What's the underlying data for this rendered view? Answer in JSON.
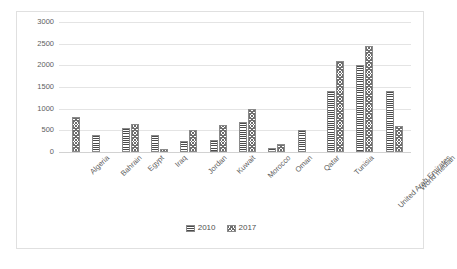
{
  "chart_data": {
    "type": "bar",
    "title": "",
    "subtitle": "",
    "xlabel": "",
    "ylabel": "",
    "ylim": [
      0,
      3000
    ],
    "yticks": [
      0,
      500,
      1000,
      1500,
      2000,
      2500,
      3000
    ],
    "ytick_labels": [
      "0",
      "500",
      "1000",
      "1500",
      "2000",
      "2500",
      "3000"
    ],
    "grid": true,
    "legend_position": "bottom-center",
    "categories": [
      "Algeria",
      "Bahrain",
      "Egypt",
      "Iraq",
      "Jordan",
      "Kuwait",
      "Morocco",
      "Oman",
      "Qatar",
      "Tunisia",
      "United Arab Emirates",
      "World median"
    ],
    "series": [
      {
        "name": "2010",
        "pattern": "horizontal-stripes",
        "color": "#4b4b4b",
        "values": [
          0,
          400,
          550,
          400,
          250,
          280,
          700,
          100,
          500,
          1400,
          2000,
          1400
        ]
      },
      {
        "name": "2017",
        "pattern": "checkered",
        "color": "#6e6e6e",
        "values": [
          800,
          0,
          650,
          60,
          500,
          620,
          1000,
          180,
          0,
          2100,
          2450,
          600
        ]
      }
    ]
  },
  "legend": {
    "items": [
      {
        "label": "2010"
      },
      {
        "label": "2017"
      }
    ]
  }
}
